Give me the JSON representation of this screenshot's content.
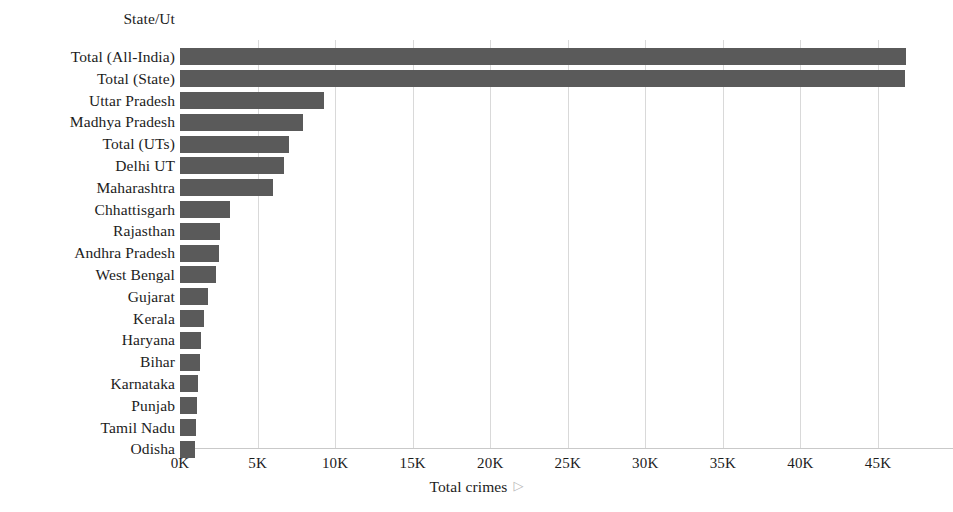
{
  "chart_data": {
    "type": "bar",
    "orientation": "horizontal",
    "title": "",
    "xlabel": "Total crimes",
    "ylabel": "State/Ut",
    "xlim": [
      0,
      48000
    ],
    "ylim": null,
    "grid": true,
    "legend": null,
    "bar_color": "#5a5a5a",
    "background_color": "#ffffff",
    "gridline_color": "#d9d9d9",
    "text_color": "#1c1c1c",
    "xticks": [
      {
        "label": "0K",
        "value": 0
      },
      {
        "label": "5K",
        "value": 5000
      },
      {
        "label": "10K",
        "value": 10000
      },
      {
        "label": "15K",
        "value": 15000
      },
      {
        "label": "20K",
        "value": 20000
      },
      {
        "label": "25K",
        "value": 25000
      },
      {
        "label": "30K",
        "value": 30000
      },
      {
        "label": "35K",
        "value": 35000
      },
      {
        "label": "40K",
        "value": 40000
      },
      {
        "label": "45K",
        "value": 45000
      }
    ],
    "categories": [
      "Total (All-India)",
      "Total (State)",
      "Uttar Pradesh",
      "Madhya Pradesh",
      "Total (UTs)",
      "Delhi UT",
      "Maharashtra",
      "Chhattisgarh",
      "Rajasthan",
      "Andhra Pradesh",
      "West Bengal",
      "Gujarat",
      "Kerala",
      "Haryana",
      "Bihar",
      "Karnataka",
      "Punjab",
      "Tamil Nadu",
      "Odisha"
    ],
    "values": [
      46800,
      46750,
      9300,
      7900,
      7000,
      6700,
      6000,
      3250,
      2600,
      2500,
      2350,
      1800,
      1550,
      1350,
      1300,
      1150,
      1100,
      1050,
      950
    ]
  },
  "axis": {
    "y_title": "State/Ut",
    "x_title": "Total crimes",
    "x_title_artifact": "☷"
  }
}
